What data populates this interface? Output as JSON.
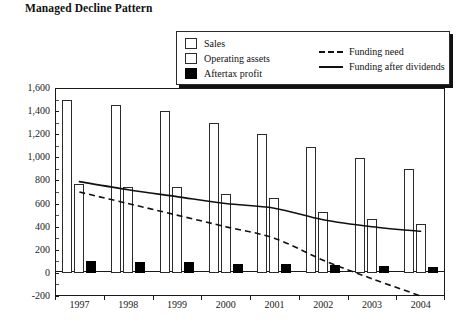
{
  "chart_data": {
    "type": "bar",
    "title": "Managed Decline Pattern",
    "xlabel": "",
    "ylabel": "",
    "categories": [
      "1997",
      "1998",
      "1999",
      "2000",
      "2001",
      "2002",
      "2003",
      "2004"
    ],
    "ylim": [
      -200,
      1600
    ],
    "ytick_step": 200,
    "ytick_labels": [
      "1,600",
      "1,400",
      "1,200",
      "1,000",
      "800",
      "600",
      "400",
      "200",
      "0",
      "-200"
    ],
    "ytick_values": [
      1600,
      1400,
      1200,
      1000,
      800,
      600,
      400,
      200,
      0,
      -200
    ],
    "grid": false,
    "legend_position": "top-right",
    "series": [
      {
        "name": "Sales",
        "kind": "bar",
        "style": "open",
        "values": [
          1500,
          1450,
          1400,
          1300,
          1200,
          1090,
          990,
          900
        ]
      },
      {
        "name": "Operating assets",
        "kind": "bar",
        "style": "open",
        "values": [
          770,
          740,
          740,
          680,
          650,
          530,
          470,
          420
        ]
      },
      {
        "name": "Aftertax profit",
        "kind": "bar",
        "style": "filled",
        "values": [
          100,
          95,
          90,
          80,
          75,
          70,
          60,
          55
        ]
      },
      {
        "name": "Funding need",
        "kind": "line",
        "style": "dashed",
        "values": [
          700,
          600,
          500,
          400,
          300,
          110,
          -50,
          -200
        ]
      },
      {
        "name": "Funding after dividends",
        "kind": "line",
        "style": "solid",
        "values": [
          790,
          720,
          660,
          600,
          560,
          460,
          400,
          360
        ]
      }
    ]
  },
  "legend": {
    "bar_entries": [
      {
        "label": "Sales",
        "swatch": "open-square"
      },
      {
        "label": "Operating assets",
        "swatch": "open-square"
      },
      {
        "label": "Aftertax profit",
        "swatch": "filled-square"
      }
    ],
    "line_entries": [
      {
        "label": "Funding need",
        "swatch": "dashed-line"
      },
      {
        "label": "Funding after dividends",
        "swatch": "solid-line"
      }
    ]
  },
  "colors": {
    "ink": "#111111",
    "bar_open_fill": "#ffffff",
    "bar_solid_fill": "#000000",
    "background": "#ffffff"
  }
}
